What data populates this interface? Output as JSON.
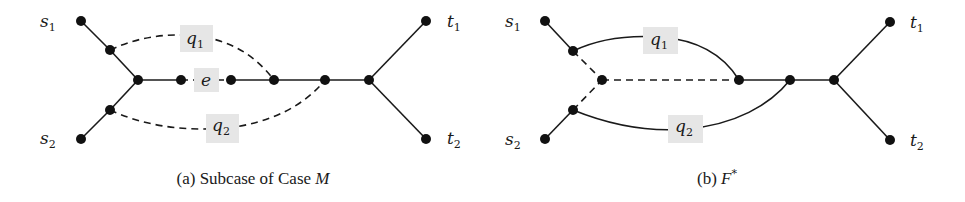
{
  "figure": {
    "panels": [
      {
        "id": "a",
        "caption_prefix": "(a) Subcase of Case ",
        "caption_var": "M",
        "terminals": {
          "s1": {
            "base": "s",
            "sub": "1"
          },
          "s2": {
            "base": "s",
            "sub": "2"
          },
          "t1": {
            "base": "t",
            "sub": "1"
          },
          "t2": {
            "base": "t",
            "sub": "2"
          }
        },
        "path_labels": {
          "q1": {
            "base": "q",
            "sub": "1",
            "style": "dashed"
          },
          "q2": {
            "base": "q",
            "sub": "2",
            "style": "dashed"
          },
          "e": {
            "base": "e",
            "sub": "",
            "style": "dashed"
          }
        }
      },
      {
        "id": "b",
        "caption_prefix": "(b) ",
        "caption_var": "F",
        "caption_sup": "*",
        "terminals": {
          "s1": {
            "base": "s",
            "sub": "1"
          },
          "s2": {
            "base": "s",
            "sub": "2"
          },
          "t1": {
            "base": "t",
            "sub": "1"
          },
          "t2": {
            "base": "t",
            "sub": "2"
          }
        },
        "path_labels": {
          "q1": {
            "base": "q",
            "sub": "1",
            "style": "solid"
          },
          "q2": {
            "base": "q",
            "sub": "2",
            "style": "solid"
          }
        }
      }
    ],
    "colors": {
      "edge": "#1a1a1a",
      "node": "#111111",
      "label_background": "#e6e6e6"
    }
  }
}
